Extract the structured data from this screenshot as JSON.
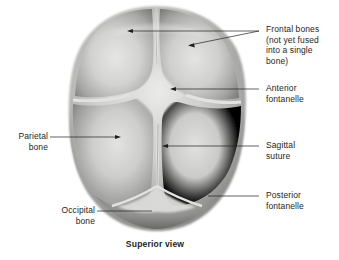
{
  "figure": {
    "title_caption": "Superior view",
    "background_color": "#ffffff",
    "ink_color": "#231f20"
  },
  "labels": {
    "frontal_bones": "Frontal bones\n(not yet fused\ninto a single\nbone)",
    "anterior_fontanelle": "Anterior\nfontanelle",
    "sagittal_suture": "Sagittal\nsuture",
    "posterior_fontanelle": "Posterior\nfontanelle",
    "parietal_bone": "Parietal\nbone",
    "occipital_bone": "Occipital\nbone"
  },
  "anatomy": {
    "structures": [
      "frontal bone left",
      "frontal bone right",
      "parietal bone left",
      "parietal bone right",
      "occipital bone",
      "anterior fontanelle",
      "posterior fontanelle",
      "sagittal suture",
      "metopic suture",
      "coronal suture left",
      "coronal suture right",
      "lambdoid suture left",
      "lambdoid suture right"
    ],
    "skull_tone_light": "#d8d8d6",
    "skull_tone_mid": "#b4b4b2",
    "skull_tone_dark": "#6e6e6c",
    "suture_tone": "#e4e4e2"
  }
}
